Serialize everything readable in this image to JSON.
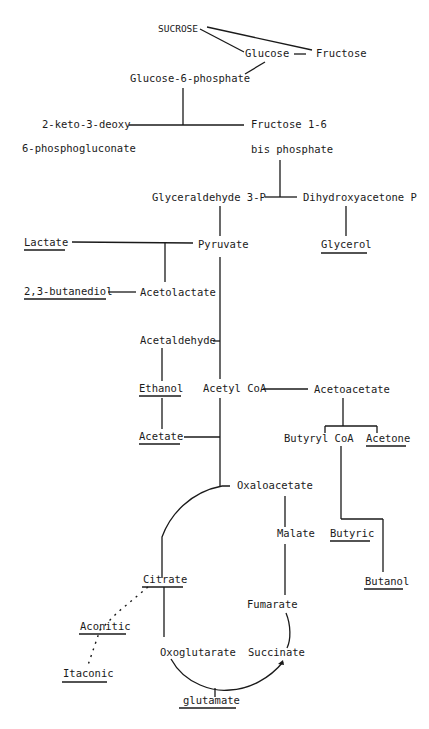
{
  "diagram": {
    "nodes": {
      "sucrose": "SUCROSE",
      "glucose": "Glucose",
      "fructose": "Fructose",
      "g6p": "Glucose-6-phosphate",
      "kdpg_1": "2-keto-3-deoxy",
      "kdpg_2": "6-phosphogluconate",
      "fbp_1": "Fructose 1-6",
      "fbp_2": "bis phosphate",
      "g3p": "Glyceraldehyde 3-P",
      "dhap": "Dihydroxyacetone P",
      "lactate": "Lactate",
      "pyruvate": "Pyruvate",
      "glycerol": "Glycerol",
      "butanediol": "2,3-butanediol",
      "acetolactate": "Acetolactate",
      "acetaldehyde": "Acetaldehyde",
      "ethanol": "Ethanol",
      "acetylcoa": "Acetyl CoA",
      "acetoacetate": "Acetoacetate",
      "acetate": "Acetate",
      "butyrylcoa": "Butyryl CoA",
      "acetone": "Acetone",
      "oxaloacetate": "Oxaloacetate",
      "malate": "Malate",
      "butyric": "Butyric",
      "butanol": "Butanol",
      "citrate": "Citrate",
      "fumarate": "Fumarate",
      "aconitic": "Aconitic",
      "oxoglutarate": "Oxoglutarate",
      "succinate": "Succinate",
      "itaconic": "Itaconic",
      "glutamate": "glutamate"
    },
    "end_products_underlined": [
      "Lactate",
      "Glycerol",
      "2,3-butanediol",
      "Ethanol",
      "Acetate",
      "Acetone",
      "Butyric",
      "Butanol",
      "Citrate",
      "Aconitic",
      "Itaconic",
      "glutamate"
    ],
    "colors": {
      "ink": "#1a1a1a",
      "background": "#ffffff"
    }
  }
}
